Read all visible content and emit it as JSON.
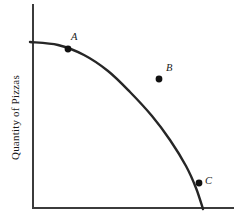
{
  "figure": {
    "background_color": "#ffffff",
    "width": 239,
    "height": 223
  },
  "axes": {
    "y_axis_label": "Quantity of Pizzas",
    "x_axis_label": "",
    "axis_color": "#3b3b3b",
    "origin_x": 33,
    "origin_y": 208,
    "y_axis_top": 5,
    "x_axis_right": 233
  },
  "chart_data": {
    "type": "line",
    "title": "",
    "subtitle": "",
    "xlabel": "",
    "ylabel": "Quantity of Pizzas",
    "xlim": [
      0,
      200
    ],
    "ylim": [
      0,
      166
    ],
    "grid": false,
    "legend": "none",
    "curve_name": "Production Possibilities Frontier",
    "curve_color": "#262626",
    "curve_points": [
      {
        "px": 30,
        "py": 42
      },
      {
        "px": 58,
        "py": 45
      },
      {
        "px": 84,
        "py": 55
      },
      {
        "px": 108,
        "py": 71
      },
      {
        "px": 130,
        "py": 92
      },
      {
        "px": 152,
        "py": 116
      },
      {
        "px": 170,
        "py": 140
      },
      {
        "px": 186,
        "py": 166
      },
      {
        "px": 196,
        "py": 188
      },
      {
        "px": 203,
        "py": 209
      }
    ],
    "annotations": [
      {
        "label": "A",
        "position": "on-curve",
        "dot_px": 68,
        "dot_py": 49,
        "label_px": 71,
        "label_py": 40,
        "color": "#111111"
      },
      {
        "label": "B",
        "position": "inside-frontier",
        "dot_px": 159,
        "dot_py": 79,
        "label_px": 166,
        "label_py": 71,
        "color": "#111111"
      },
      {
        "label": "C",
        "position": "on-curve",
        "dot_px": 199,
        "dot_py": 183,
        "label_px": 205,
        "label_py": 184,
        "color": "#111111"
      }
    ]
  }
}
